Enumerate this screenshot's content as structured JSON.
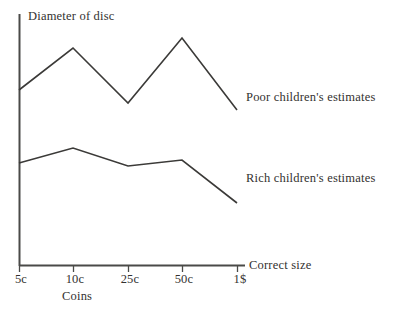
{
  "chart_data": {
    "type": "line",
    "title": "",
    "ylabel": "Diameter of disc",
    "xlabel": "Coins",
    "x_axis_end_label": "Correct size",
    "categories": [
      "5c",
      "10c",
      "25c",
      "50c",
      "1$"
    ],
    "grid": false,
    "legend_position": "right-inline",
    "series": [
      {
        "name": "Poor children's estimates",
        "values": [
          48,
          70,
          37,
          79,
          34
        ],
        "pixel_points": [
          [
            19,
            90
          ],
          [
            73,
            48
          ],
          [
            128,
            103
          ],
          [
            182,
            38
          ],
          [
            237,
            110
          ]
        ]
      },
      {
        "name": "Rich children's estimates",
        "values": [
          20,
          27,
          19,
          22,
          3
        ],
        "pixel_points": [
          [
            19,
            163
          ],
          [
            73,
            148
          ],
          [
            128,
            166
          ],
          [
            182,
            160
          ],
          [
            237,
            203
          ]
        ]
      }
    ],
    "axis": {
      "origin_px": [
        19,
        266
      ],
      "y_top_px": 14,
      "x_right_px": 245,
      "tick_positions_px": [
        19,
        73,
        128,
        182,
        237
      ]
    },
    "line_color": "#3b3a38",
    "axis_color": "#4a4a48"
  },
  "labels": {
    "y_axis_title": "Diameter of disc",
    "x_axis_name": "Coins",
    "x_axis_end": "Correct size",
    "series_poor": "Poor children's estimates",
    "series_rich": "Rich children's estimates",
    "tick_1": "5c",
    "tick_2": "10c",
    "tick_3": "25c",
    "tick_4": "50c",
    "tick_5": "1$"
  }
}
